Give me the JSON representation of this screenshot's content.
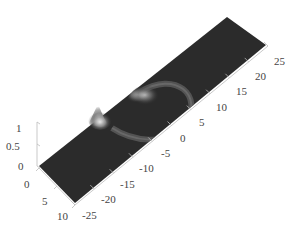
{
  "chart_data": {
    "type": "surface3d",
    "title": "",
    "xlabel": "",
    "ylabel": "",
    "zlabel": "",
    "x_axis": {
      "ticks": [
        0,
        5,
        10
      ],
      "range": [
        0,
        10
      ]
    },
    "y_axis": {
      "ticks": [
        -25,
        -20,
        -15,
        -10,
        -5,
        0,
        5,
        10,
        15,
        20,
        25
      ],
      "range": [
        -25,
        25
      ]
    },
    "z_axis": {
      "ticks": [
        0,
        0.5,
        1
      ],
      "range": [
        0,
        1
      ]
    },
    "colormap": "gray",
    "surface_base_color": "#2b2b2b",
    "features": [
      {
        "type": "peak",
        "x": 0,
        "y": -13,
        "height": 0.9,
        "label": "sharp peak near left edge"
      },
      {
        "type": "peak",
        "x": 0,
        "y": -5,
        "height": 0.35,
        "label": "smaller peak"
      },
      {
        "type": "ring_wave",
        "center_x": 0,
        "center_y": -5,
        "radius": 8,
        "height": 0.15,
        "label": "semicircular ripple"
      }
    ],
    "grid": false,
    "legend": "none"
  },
  "labels": {
    "z": [
      "1",
      "0.5",
      "0"
    ],
    "x": [
      "0",
      "5",
      "10"
    ],
    "y": [
      "-25",
      "-20",
      "-15",
      "-10",
      "-5",
      "0",
      "5",
      "10",
      "15",
      "20",
      "25"
    ]
  }
}
